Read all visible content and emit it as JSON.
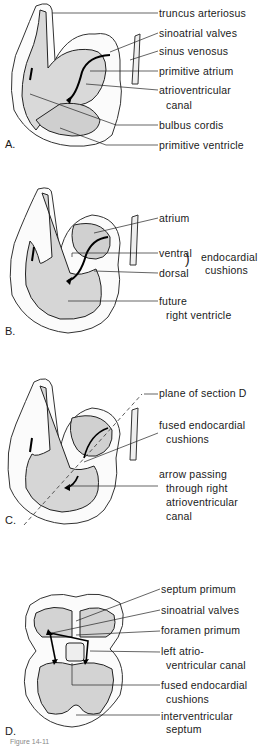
{
  "figure": {
    "panels": [
      {
        "id": "A",
        "label": "A.",
        "callouts": [
          {
            "text": "truncus arteriosus"
          },
          {
            "text": "sinoatrial valves"
          },
          {
            "text": "sinus venosus"
          },
          {
            "text": "primitive atrium"
          },
          {
            "text": "atrioventricular"
          },
          {
            "text": "canal"
          },
          {
            "text": "bulbus cordis"
          },
          {
            "text": "primitive ventricle"
          }
        ]
      },
      {
        "id": "B",
        "label": "B.",
        "callouts": [
          {
            "text": "atrium"
          },
          {
            "text": "ventral"
          },
          {
            "text": "dorsal"
          },
          {
            "text": "endocardial"
          },
          {
            "text": "cushions"
          },
          {
            "text": "future"
          },
          {
            "text": "right ventricle"
          }
        ]
      },
      {
        "id": "C",
        "label": "C.",
        "callouts": [
          {
            "text": "plane of section D"
          },
          {
            "text": "fused endocardial"
          },
          {
            "text": "cushions"
          },
          {
            "text": "arrow passing"
          },
          {
            "text": "through right"
          },
          {
            "text": "atrioventricular"
          },
          {
            "text": "canal"
          }
        ]
      },
      {
        "id": "D",
        "label": "D.",
        "callouts": [
          {
            "text": "septum primum"
          },
          {
            "text": "sinoatrial valves"
          },
          {
            "text": "foramen primum"
          },
          {
            "text": "left atrio-"
          },
          {
            "text": "ventricular canal"
          },
          {
            "text": "fused endocardial"
          },
          {
            "text": "cushions"
          },
          {
            "text": "interventricular"
          },
          {
            "text": "septum"
          }
        ]
      }
    ],
    "caption": "Figure 14-11"
  }
}
